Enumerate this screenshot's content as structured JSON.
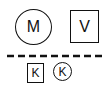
{
  "diagram": {
    "top_row": [
      {
        "shape": "circle",
        "label": "M"
      },
      {
        "shape": "square",
        "label": "V"
      }
    ],
    "divider": {
      "style": "dashed",
      "color": "#111111"
    },
    "bottom_row": [
      {
        "shape": "square",
        "label": "K"
      },
      {
        "shape": "circle",
        "label": "K"
      }
    ],
    "colors": {
      "stroke": "#111111",
      "background": "#ffffff"
    }
  }
}
